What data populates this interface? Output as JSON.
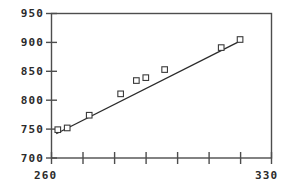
{
  "chart_data": {
    "type": "scatter",
    "title": "",
    "subtitle": "",
    "xlabel": "",
    "ylabel": "",
    "xlim": [
      260,
      330
    ],
    "ylim": [
      700,
      950
    ],
    "grid": false,
    "legend": null,
    "x_tick_labels": [
      "260",
      "330"
    ],
    "x_tick_values": [
      260,
      330
    ],
    "x_tick_minor_values": [
      270,
      280,
      290,
      300,
      310,
      320
    ],
    "y_tick_labels": [
      "950",
      "900",
      "850",
      "800",
      "750",
      "700"
    ],
    "y_tick_values": [
      950,
      900,
      850,
      800,
      750,
      700
    ],
    "marker_style": "open-square",
    "series": [
      {
        "name": "data",
        "x": [
          262,
          265,
          272,
          282,
          287,
          290,
          296,
          314,
          320
        ],
        "y": [
          749,
          752,
          774,
          811,
          834,
          839,
          853,
          891,
          905
        ]
      }
    ],
    "fit_line": {
      "name": "linear-fit",
      "x_start": 261.5,
      "y_start": 742,
      "x_end": 319.5,
      "y_end": 901
    }
  },
  "style": {
    "axis_color": "#4d4d4d",
    "marker_color": "#3a3a3a",
    "line_color": "#2a2a2a",
    "text_color": "#2b2b2b",
    "background": "#ffffff"
  }
}
